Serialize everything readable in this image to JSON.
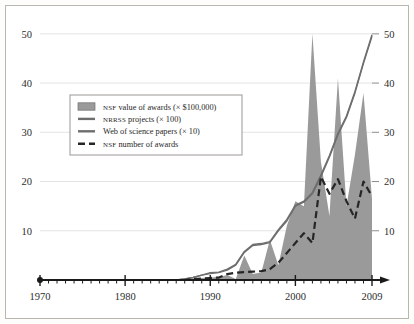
{
  "figure": {
    "background_color": "#ffffff",
    "frame_color": "#b9b6b0",
    "area_fill_color": "#9a9a9a",
    "line_color": "#6e6e6e",
    "dash_color": "#262626",
    "grid_color": "#e4e4e4",
    "axis_color": "#1a1a1a"
  },
  "axes": {
    "x_label_text": "",
    "y_label_text": "",
    "x_ticks": [
      "1970",
      "1980",
      "1990",
      "2000",
      "2009"
    ],
    "x_tick_values": [
      1970,
      1980,
      1990,
      2000,
      2009
    ],
    "x_minor_step": 1,
    "y_ticks_left": [
      "10",
      "20",
      "30",
      "40",
      "50"
    ],
    "y_ticks_right": [
      "10",
      "20",
      "30",
      "40",
      "50"
    ],
    "y_tick_values": [
      10,
      20,
      30,
      40,
      50
    ],
    "xlim": [
      1970,
      2009
    ],
    "ylim": [
      0,
      52
    ],
    "origin_marker": "filled-dot",
    "x_axis_arrow": "right"
  },
  "legend": {
    "position": "upper-left-inset",
    "border_color": "#9b9893",
    "background": "#ffffff",
    "items": [
      {
        "marker": "filled-swatch",
        "small_caps": "NSF",
        "label": " value of awards (× $100,000)",
        "full_label": "NSF value of awards (× $100,000)"
      },
      {
        "marker": "solid-line",
        "small_caps": "NRRSS",
        "label": " projects (× 100)",
        "full_label": "NRRSS projects (× 100)"
      },
      {
        "marker": "solid-line",
        "small_caps": "",
        "label": "Web of science papers (× 10)",
        "full_label": "Web of science papers (× 10)"
      },
      {
        "marker": "dashed-line",
        "small_caps": "NSF",
        "label": " number of awards",
        "full_label": "NSF number of awards"
      }
    ]
  },
  "chart_data": {
    "type": "area",
    "title": "",
    "subtitle": "",
    "xlabel": "",
    "ylabel": "",
    "xlim": [
      1970,
      2009
    ],
    "ylim": [
      0,
      52
    ],
    "grid": true,
    "legend_position": "upper-left-inset",
    "x": [
      1970,
      1971,
      1972,
      1973,
      1974,
      1975,
      1976,
      1977,
      1978,
      1979,
      1980,
      1981,
      1982,
      1983,
      1984,
      1985,
      1986,
      1987,
      1988,
      1989,
      1990,
      1991,
      1992,
      1993,
      1994,
      1995,
      1996,
      1997,
      1998,
      1999,
      2000,
      2001,
      2002,
      2003,
      2004,
      2005,
      2006,
      2007,
      2008,
      2009
    ],
    "series": [
      {
        "name": "NSF value of awards (× $100,000)",
        "type": "area",
        "values": [
          0,
          0,
          0,
          0,
          0,
          0,
          0,
          0,
          0,
          0,
          0,
          0,
          0,
          0,
          0,
          0,
          0,
          0,
          0.2,
          0.4,
          0.5,
          0.6,
          1.0,
          0.2,
          5.0,
          1.2,
          1.5,
          8.2,
          3.0,
          11.0,
          16.0,
          15.0,
          50.0,
          24.0,
          13.0,
          41.0,
          15.0,
          25.5,
          38.0,
          16.5
        ]
      },
      {
        "name": "NRRSS projects (× 100)",
        "type": "line",
        "values": [
          0,
          0,
          0,
          0,
          0,
          0,
          0,
          0,
          0,
          0,
          0,
          0,
          0,
          0,
          0,
          0,
          0,
          0.2,
          0.5,
          1.0,
          1.3,
          1.5,
          2.0,
          3.0,
          5.6,
          7.0,
          7.2,
          7.6,
          10.0,
          12.0,
          15.0,
          15.8,
          17.5,
          21.0,
          25.0,
          29.5,
          33.0,
          38.0,
          44.0,
          49.5
        ]
      },
      {
        "name": "Web of science papers (× 10)",
        "type": "line",
        "values": [
          0,
          0,
          0,
          0,
          0,
          0,
          0,
          0,
          0,
          0,
          0,
          0,
          0,
          0,
          0,
          0,
          0,
          0.2,
          0.5,
          1.0,
          1.5,
          1.6,
          2.2,
          3.2,
          5.8,
          7.2,
          7.4,
          7.8,
          10.2,
          12.3,
          15.2,
          16.0,
          17.8,
          21.3,
          25.3,
          29.8,
          33.3,
          38.3,
          44.3,
          49.8
        ]
      },
      {
        "name": "NSF number of awards",
        "type": "dashed-line",
        "values": [
          0,
          0,
          0,
          0,
          0,
          0,
          0,
          0,
          0,
          0,
          0,
          0,
          0,
          0,
          0,
          0,
          0,
          0,
          0.2,
          0.3,
          0.4,
          0.5,
          1.2,
          1.5,
          1.6,
          1.7,
          1.8,
          2.2,
          3.5,
          5.5,
          7.5,
          9.5,
          7.5,
          21.0,
          17.5,
          20.5,
          16.0,
          12.5,
          20.0,
          17.0
        ]
      }
    ]
  }
}
